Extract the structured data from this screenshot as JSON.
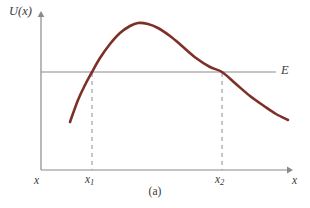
{
  "figure": {
    "caption": "(a)",
    "background_color": "#ffffff"
  },
  "axes": {
    "y_axis_label": "U(x)",
    "x_axis_label_left": "x",
    "x_axis_label_right": "x",
    "axis_color": "#8a8a8a",
    "label_color": "#3a3a3a",
    "origin_px": {
      "x": 41,
      "y": 170
    },
    "x_axis_end_px": 292,
    "y_axis_top_px": 13
  },
  "energy_line": {
    "label": "E",
    "color": "#8a8a8a",
    "y_px": 72,
    "x_start_px": 41,
    "x_end_px": 276
  },
  "turning_points": [
    {
      "label": "x",
      "subscript": "1",
      "x_px": 92,
      "dash_top_px": 73,
      "dash_bottom_px": 170,
      "dash_color": "#9a9a9a"
    },
    {
      "label": "x",
      "subscript": "2",
      "x_px": 222,
      "dash_top_px": 73,
      "dash_bottom_px": 170,
      "dash_color": "#9a9a9a"
    }
  ],
  "chart_data": {
    "type": "line",
    "title": "",
    "xlabel": "x",
    "ylabel": "U(x)",
    "legend": [
      "U(x)",
      "E"
    ],
    "grid": false,
    "curve_color": "#7d3028",
    "curve_width_px": 2.6,
    "xlim_px": [
      41,
      292
    ],
    "ylim_px": [
      170,
      13
    ],
    "series": [
      {
        "name": "U(x)",
        "description": "Potential energy curve: rises steeply, peaks, then decays",
        "points_px": [
          [
            70,
            122
          ],
          [
            78,
            100
          ],
          [
            85,
            85
          ],
          [
            92,
            72
          ],
          [
            100,
            58
          ],
          [
            110,
            44
          ],
          [
            120,
            33
          ],
          [
            130,
            26
          ],
          [
            138,
            23
          ],
          [
            148,
            24
          ],
          [
            158,
            28
          ],
          [
            170,
            36
          ],
          [
            182,
            46
          ],
          [
            196,
            58
          ],
          [
            210,
            67
          ],
          [
            222,
            72
          ],
          [
            236,
            84
          ],
          [
            250,
            96
          ],
          [
            264,
            106
          ],
          [
            276,
            114
          ],
          [
            288,
            120
          ]
        ]
      },
      {
        "name": "E",
        "description": "Constant total energy level line",
        "points_px": [
          [
            41,
            72
          ],
          [
            276,
            72
          ]
        ]
      }
    ],
    "annotations": [
      {
        "text": "E",
        "x_px": 283,
        "y_px": 72
      },
      {
        "text": "x1",
        "x_px": 92,
        "y_px": 180
      },
      {
        "text": "x2",
        "x_px": 222,
        "y_px": 180
      }
    ]
  }
}
